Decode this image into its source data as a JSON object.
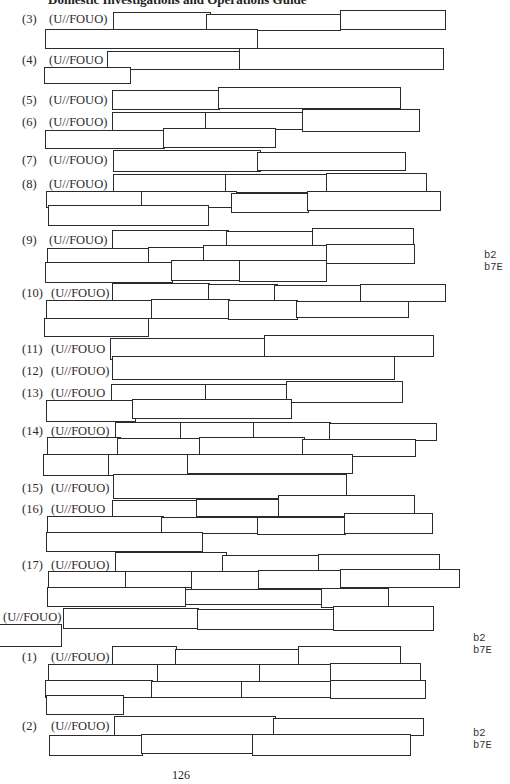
{
  "header": {
    "title": "Domestic Investigations and Operations Guide"
  },
  "marking": "(U//FOUO)",
  "items": [
    {
      "number": "(3)",
      "marking": "(U//FOUO)"
    },
    {
      "number": "(4)",
      "marking": "(U//FOUO"
    },
    {
      "number": "(5)",
      "marking": "(U//FOUO)"
    },
    {
      "number": "(6)",
      "marking": "(U//FOUO)"
    },
    {
      "number": "(7)",
      "marking": "(U//FOUO)"
    },
    {
      "number": "(8)",
      "marking": "(U//FOUO)"
    },
    {
      "number": "(9)",
      "marking": "(U//FOUO)"
    },
    {
      "number": "(10)",
      "marking": "(U//FOUO)"
    },
    {
      "number": "(11)",
      "marking": "(U//FOUO"
    },
    {
      "number": "(12)",
      "marking": "(U//FOUO)"
    },
    {
      "number": "(13)",
      "marking": "(U//FOUO"
    },
    {
      "number": "(14)",
      "marking": "(U//FOUO)"
    },
    {
      "number": "(15)",
      "marking": "(U//FOUO)"
    },
    {
      "number": "(16)",
      "marking": "(U//FOUO"
    },
    {
      "number": "(17)",
      "marking": "(U//FOUO)"
    },
    {
      "number": "",
      "marking": "(U//FOUO)"
    },
    {
      "number": "(1)",
      "marking": "(U//FOUO)"
    },
    {
      "number": "(2)",
      "marking": "(U//FOUO)"
    }
  ],
  "exemptions": [
    {
      "text": "b2\nb7E"
    },
    {
      "text": "b2\nb7E"
    },
    {
      "text": "b2\nb7E"
    }
  ],
  "footer": {
    "page_number": "126"
  }
}
